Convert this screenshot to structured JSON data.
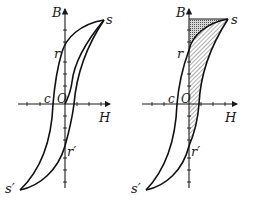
{
  "figure": {
    "panels": [
      {
        "id": "left",
        "labels": {
          "y_axis": "B",
          "x_axis": "H",
          "saturation_pos": "s",
          "remanence_pos": "r",
          "coercivity": "c",
          "origin": "O",
          "remanence_neg": "r′",
          "saturation_neg": "s′"
        },
        "shaded": false
      },
      {
        "id": "right",
        "labels": {
          "y_axis": "B",
          "x_axis": "H",
          "saturation_pos": "s",
          "remanence_pos": "r",
          "coercivity": "c",
          "origin": "O",
          "remanence_neg": "r′",
          "saturation_neg": "s′"
        },
        "shaded": true,
        "shading": {
          "triangle_region": "cross-hatched (dotted) area between B-axis, line B=Bs, and upper branch from r to s",
          "loop_region": "diagonal-hatched area between initial/lower branch and B-axis"
        }
      }
    ],
    "colors": {
      "ink": "#111111",
      "background": "#ffffff"
    }
  }
}
